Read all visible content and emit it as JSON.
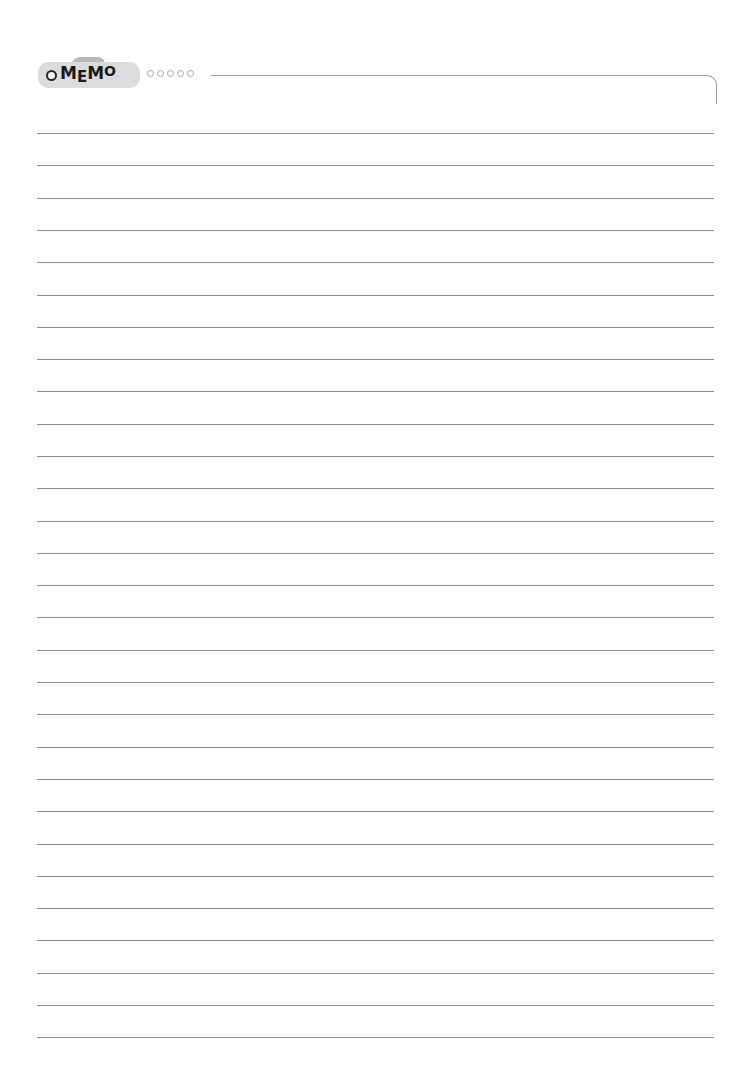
{
  "header": {
    "title_parts": [
      "M",
      "E",
      "M",
      "O"
    ],
    "title": "MEMO",
    "decor_dots": 5,
    "colors": {
      "pill": "#dcdcdc",
      "tab": "#b9b9b9",
      "text": "#1a1a1a",
      "rule": "#8c8c8c"
    }
  },
  "lines": {
    "count": 29,
    "top": 133,
    "spacing": 32.3
  }
}
